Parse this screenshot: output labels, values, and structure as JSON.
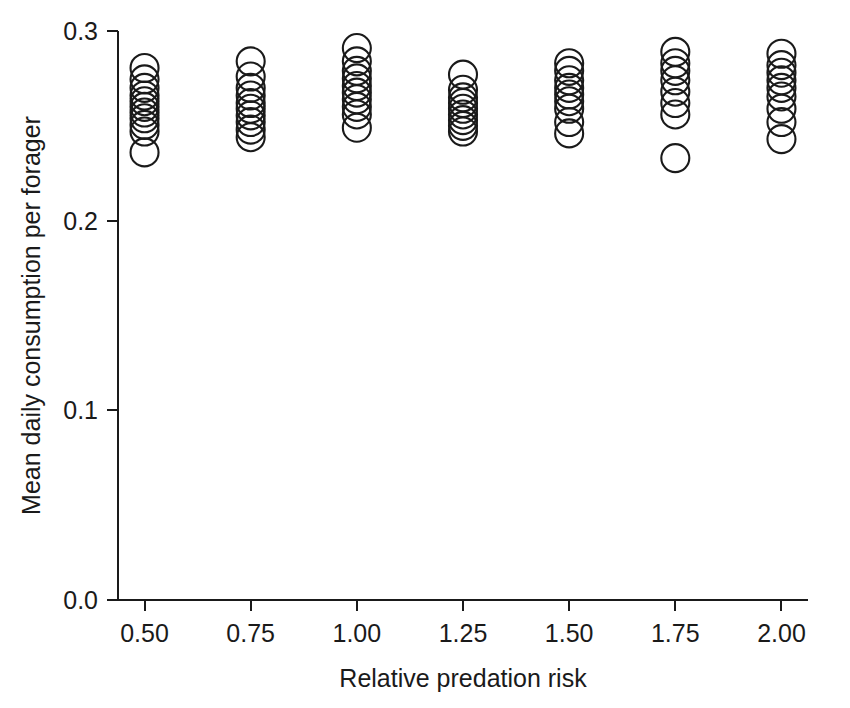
{
  "chart_data": {
    "type": "scatter",
    "title": "",
    "subtitle": "",
    "xlabel": "Relative predation risk",
    "ylabel": "Mean daily consumption per forager",
    "xlim": [
      0.4375,
      2.0625
    ],
    "ylim": [
      0.0,
      0.3
    ],
    "xtick_labels": [
      "0.50",
      "0.75",
      "1.00",
      "1.25",
      "1.50",
      "1.75",
      "2.00"
    ],
    "xtick_values": [
      0.5,
      0.75,
      1.0,
      1.25,
      1.5,
      1.75,
      2.0
    ],
    "ytick_labels": [
      "0.0",
      "0.1",
      "0.2",
      "0.3"
    ],
    "ytick_values": [
      0.0,
      0.1,
      0.2,
      0.3
    ],
    "grid": false,
    "legend": null,
    "marker": {
      "shape": "open-circle",
      "diameter_px": 28,
      "fill": "none",
      "stroke": "#1a1a1a",
      "stroke_width": 2.1
    },
    "axis_color": "#1a1a1a",
    "series": [
      {
        "name": "Mean daily consumption per forager",
        "points": [
          {
            "x": 0.5,
            "y": 0.2805
          },
          {
            "x": 0.5,
            "y": 0.2745
          },
          {
            "x": 0.5,
            "y": 0.27
          },
          {
            "x": 0.5,
            "y": 0.266
          },
          {
            "x": 0.5,
            "y": 0.263
          },
          {
            "x": 0.5,
            "y": 0.26
          },
          {
            "x": 0.5,
            "y": 0.257
          },
          {
            "x": 0.5,
            "y": 0.254
          },
          {
            "x": 0.5,
            "y": 0.2505
          },
          {
            "x": 0.5,
            "y": 0.247
          },
          {
            "x": 0.5,
            "y": 0.236
          },
          {
            "x": 0.75,
            "y": 0.284
          },
          {
            "x": 0.75,
            "y": 0.276
          },
          {
            "x": 0.75,
            "y": 0.27
          },
          {
            "x": 0.75,
            "y": 0.266
          },
          {
            "x": 0.75,
            "y": 0.262
          },
          {
            "x": 0.75,
            "y": 0.259
          },
          {
            "x": 0.75,
            "y": 0.2555
          },
          {
            "x": 0.75,
            "y": 0.252
          },
          {
            "x": 0.75,
            "y": 0.248
          },
          {
            "x": 0.75,
            "y": 0.244
          },
          {
            "x": 1.0,
            "y": 0.291
          },
          {
            "x": 1.0,
            "y": 0.284
          },
          {
            "x": 1.0,
            "y": 0.279
          },
          {
            "x": 1.0,
            "y": 0.275
          },
          {
            "x": 1.0,
            "y": 0.271
          },
          {
            "x": 1.0,
            "y": 0.2675
          },
          {
            "x": 1.0,
            "y": 0.264
          },
          {
            "x": 1.0,
            "y": 0.26
          },
          {
            "x": 1.0,
            "y": 0.256
          },
          {
            "x": 1.0,
            "y": 0.249
          },
          {
            "x": 1.25,
            "y": 0.277
          },
          {
            "x": 1.25,
            "y": 0.269
          },
          {
            "x": 1.25,
            "y": 0.265
          },
          {
            "x": 1.25,
            "y": 0.262
          },
          {
            "x": 1.25,
            "y": 0.259
          },
          {
            "x": 1.25,
            "y": 0.256
          },
          {
            "x": 1.25,
            "y": 0.253
          },
          {
            "x": 1.25,
            "y": 0.25
          },
          {
            "x": 1.25,
            "y": 0.247
          },
          {
            "x": 1.5,
            "y": 0.283
          },
          {
            "x": 1.5,
            "y": 0.279
          },
          {
            "x": 1.5,
            "y": 0.274
          },
          {
            "x": 1.5,
            "y": 0.27
          },
          {
            "x": 1.5,
            "y": 0.2665
          },
          {
            "x": 1.5,
            "y": 0.263
          },
          {
            "x": 1.5,
            "y": 0.259
          },
          {
            "x": 1.5,
            "y": 0.252
          },
          {
            "x": 1.5,
            "y": 0.246
          },
          {
            "x": 1.75,
            "y": 0.289
          },
          {
            "x": 1.75,
            "y": 0.283
          },
          {
            "x": 1.75,
            "y": 0.279
          },
          {
            "x": 1.75,
            "y": 0.274
          },
          {
            "x": 1.75,
            "y": 0.268
          },
          {
            "x": 1.75,
            "y": 0.262
          },
          {
            "x": 1.75,
            "y": 0.256
          },
          {
            "x": 1.75,
            "y": 0.233
          },
          {
            "x": 2.0,
            "y": 0.288
          },
          {
            "x": 2.0,
            "y": 0.282
          },
          {
            "x": 2.0,
            "y": 0.278
          },
          {
            "x": 2.0,
            "y": 0.274
          },
          {
            "x": 2.0,
            "y": 0.27
          },
          {
            "x": 2.0,
            "y": 0.2655
          },
          {
            "x": 2.0,
            "y": 0.259
          },
          {
            "x": 2.0,
            "y": 0.252
          },
          {
            "x": 2.0,
            "y": 0.243
          }
        ]
      }
    ]
  },
  "figure": {
    "background": "#ffffff",
    "plot_left_px": 118,
    "plot_right_px": 808,
    "plot_top_px": 31,
    "plot_bottom_px": 600
  }
}
